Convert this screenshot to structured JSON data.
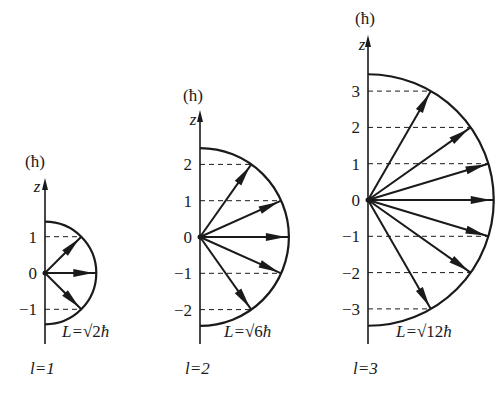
{
  "figure": {
    "caption": "",
    "unit_label": "(ħ)",
    "axis_label": "z",
    "colors": {
      "ink": "#1a1a1a",
      "background": "#ffffff"
    },
    "panels": [
      {
        "id": "l1",
        "l": 1,
        "l_label": "l=1",
        "L_label_prefix": "L=",
        "L_label_radicand": "2",
        "L_label_suffix": "ħ",
        "L_magnitude_over_hbar": 1.414,
        "m_values": [
          1,
          0,
          -1
        ],
        "tick_labels": [
          "1",
          "0",
          "−1"
        ]
      },
      {
        "id": "l2",
        "l": 2,
        "l_label": "l=2",
        "L_label_prefix": "L=",
        "L_label_radicand": "6",
        "L_label_suffix": "ħ",
        "L_magnitude_over_hbar": 2.449,
        "m_values": [
          2,
          1,
          0,
          -1,
          -2
        ],
        "tick_labels": [
          "2",
          "1",
          "0",
          "−1",
          "−2"
        ]
      },
      {
        "id": "l3",
        "l": 3,
        "l_label": "l=3",
        "L_label_prefix": "L=",
        "L_label_radicand": "12",
        "L_label_suffix": "ħ",
        "L_magnitude_over_hbar": 3.464,
        "m_values": [
          3,
          2,
          1,
          0,
          -1,
          -2,
          -3
        ],
        "tick_labels": [
          "3",
          "2",
          "1",
          "0",
          "−1",
          "−2",
          "−3"
        ]
      }
    ]
  }
}
